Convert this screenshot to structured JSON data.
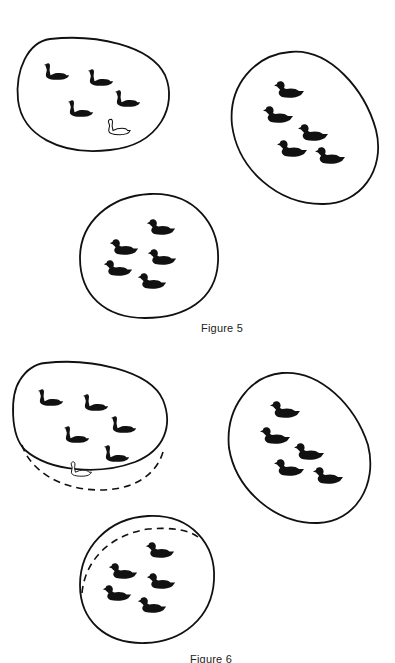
{
  "figures": [
    {
      "caption": "Figure 5",
      "sets": [
        {
          "name": "set-top-left",
          "black_swans": 4,
          "white_swans": 1,
          "bird_type": "swan"
        },
        {
          "name": "set-top-right",
          "black_swans": 5,
          "white_swans": 0,
          "bird_type": "swan"
        },
        {
          "name": "set-bottom-center",
          "black_ducks": 5,
          "bird_type": "duck"
        }
      ]
    },
    {
      "caption": "Figure 6",
      "sets": [
        {
          "name": "set-left-expanded",
          "black_swans": 5,
          "white_swans": 1,
          "bird_type": "swan",
          "boundary_extension": "dashed-bottom"
        },
        {
          "name": "set-right",
          "black_swans": 5,
          "white_swans": 0,
          "bird_type": "swan"
        },
        {
          "name": "set-bottom-contracted",
          "black_ducks": 5,
          "bird_type": "duck",
          "boundary_extension": "dashed-top-left"
        }
      ]
    }
  ],
  "colors": {
    "ink": "#111111",
    "background": "#ffffff"
  }
}
